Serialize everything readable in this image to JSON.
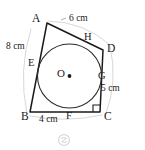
{
  "figure": {
    "kind": "tangential-quadrilateral-with-incircle",
    "shape_name": "quadrilateral ABCD",
    "colors": {
      "stroke": "#1a1a1a",
      "circle_stroke": "#2b2b2b",
      "ghost_stroke": "#cfcfcf",
      "background": "#ffffff",
      "label_text": "#1a1a1a",
      "watermark": "#b8b8b8"
    },
    "vertices": [
      {
        "id": "A",
        "label": "A",
        "x": 47,
        "y": 23,
        "label_x": 32,
        "label_y": 13
      },
      {
        "id": "B",
        "label": "B",
        "x": 30,
        "y": 112,
        "label_x": 21,
        "label_y": 111
      },
      {
        "id": "C",
        "label": "C",
        "x": 100,
        "y": 112,
        "label_x": 104,
        "label_y": 111
      },
      {
        "id": "D",
        "label": "D",
        "x": 103,
        "y": 50,
        "label_x": 107,
        "label_y": 43
      }
    ],
    "tangent_points": [
      {
        "id": "E",
        "label": "E",
        "on_side": "AB",
        "x": 36,
        "y": 67,
        "label_x": 28,
        "label_y": 58
      },
      {
        "id": "F",
        "label": "F",
        "on_side": "BC",
        "x": 68,
        "y": 110,
        "label_x": 66,
        "label_y": 111
      },
      {
        "id": "G",
        "label": "G",
        "on_side": "CD",
        "x": 101,
        "y": 81,
        "label_x": 98,
        "label_y": 71
      },
      {
        "id": "H",
        "label": "H",
        "on_side": "AD",
        "x": 92,
        "y": 41,
        "label_x": 84,
        "label_y": 32
      }
    ],
    "circle": {
      "center_label": "O",
      "center_label_x": 57,
      "center_label_y": 68,
      "cx": 69.5,
      "cy": 76,
      "r": 32,
      "center_dot_r": 1.9
    },
    "measurements": [
      {
        "id": "AH",
        "text": "6 cm",
        "x": 69,
        "y": 14,
        "segment": "A to H"
      },
      {
        "id": "AB",
        "text": "8 cm",
        "x": 6,
        "y": 42,
        "segment": "A to B"
      },
      {
        "id": "BF",
        "text": "4 cm",
        "x": 39,
        "y": 115,
        "segment": "B to F"
      },
      {
        "id": "GC",
        "text": "5 cm",
        "x": 101,
        "y": 84,
        "segment": "G to C"
      }
    ],
    "right_angle": {
      "at_vertex": "C",
      "size": 7,
      "marker": "square"
    },
    "watermark": {
      "glyph": "ⓒ",
      "x": 60,
      "y": 136
    }
  }
}
